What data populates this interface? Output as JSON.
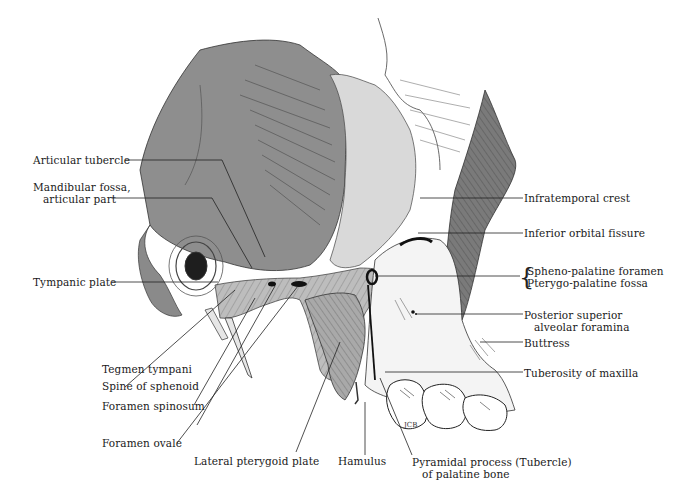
{
  "figure": {
    "signature": "JCB"
  },
  "labels": {
    "left": [
      {
        "id": "articular-tubercle",
        "text": "Articular tubercle"
      },
      {
        "id": "mandibular-fossa",
        "line1": "Mandibular fossa,",
        "line2": "articular part"
      },
      {
        "id": "tympanic-plate",
        "text": "Tympanic plate"
      },
      {
        "id": "tegmen-tympani",
        "text": "Tegmen tympani"
      },
      {
        "id": "spine-of-sphenoid",
        "text": "Spine of sphenoid"
      },
      {
        "id": "foramen-spinosum",
        "text": "Foramen spinosum"
      },
      {
        "id": "foramen-ovale",
        "text": "Foramen ovale"
      }
    ],
    "bottom": [
      {
        "id": "lateral-pterygoid-plate",
        "text": "Lateral pterygoid plate"
      },
      {
        "id": "hamulus",
        "text": "Hamulus"
      },
      {
        "id": "pyramidal-process",
        "line1": "Pyramidal process (Tubercle)",
        "line2": "of palatine bone"
      }
    ],
    "right": [
      {
        "id": "infratemporal-crest",
        "text": "Infratemporal crest"
      },
      {
        "id": "inferior-orbital-fissure",
        "text": "Inferior orbital fissure"
      },
      {
        "id": "spheno-palatine-foramen",
        "text": "Spheno-palatine foramen"
      },
      {
        "id": "pterygo-palatine-fossa",
        "text": "Pterygo-palatine fossa"
      },
      {
        "id": "posterior-superior-alveolar-foramina",
        "line1": "Posterior superior",
        "line2": "alveolar foramina"
      },
      {
        "id": "buttress",
        "text": "Buttress"
      },
      {
        "id": "tuberosity-of-maxilla",
        "text": "Tuberosity of maxilla"
      }
    ]
  },
  "colors": {
    "squama_gray": "#8e8e8e",
    "dark_gray": "#6f6f6f",
    "light_gray": "#cfcfcf",
    "line": "#222222",
    "background": "#ffffff"
  }
}
